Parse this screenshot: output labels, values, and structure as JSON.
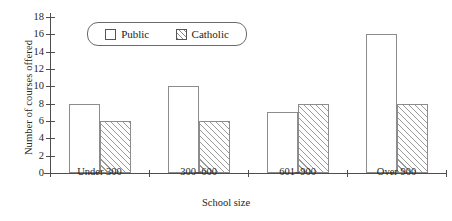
{
  "chart_data": {
    "type": "bar",
    "title": "",
    "xlabel": "School size",
    "ylabel": "Number of courses offered",
    "categories": [
      "Under 300",
      "300–600",
      "601–900",
      "Over 900"
    ],
    "series": [
      {
        "name": "Public",
        "values": [
          8,
          10,
          7,
          16
        ]
      },
      {
        "name": "Catholic",
        "values": [
          6,
          6,
          8,
          8
        ]
      }
    ],
    "ylim": [
      0,
      18
    ],
    "ytick_labels": [
      "0",
      "2",
      "4",
      "6",
      "8",
      "10",
      "12",
      "14",
      "16",
      "18"
    ],
    "ytick_values": [
      0,
      2,
      4,
      6,
      8,
      10,
      12,
      14,
      16,
      18
    ],
    "grid": false,
    "legend_position": "top-left-inside",
    "legend_entries": [
      "Public",
      "Catholic"
    ]
  },
  "legend": {
    "public_label": "Public",
    "catholic_label": "Catholic"
  },
  "axes": {
    "y_title": "Number of courses offered",
    "x_title": "School size"
  },
  "colors": {
    "axis": "#4d4d4d",
    "bar_outline": "#8c8c8c",
    "hatch": "#9a9a9a",
    "background": "#ffffff",
    "text": "#262626"
  }
}
